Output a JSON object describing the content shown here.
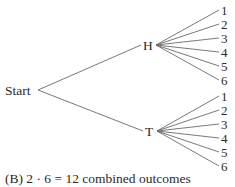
{
  "diagram": {
    "type": "tree",
    "root": {
      "label": "Start",
      "x": 38,
      "y": 90
    },
    "level1": [
      {
        "label": "H",
        "x": 156,
        "y": 45,
        "label_x": 143,
        "label_y": 50
      },
      {
        "label": "T",
        "x": 157,
        "y": 131,
        "label_x": 145,
        "label_y": 136
      }
    ],
    "leaves": {
      "labels": [
        "1",
        "2",
        "3",
        "4",
        "5",
        "6"
      ],
      "end_x": 219,
      "label_x": 221,
      "H_y": [
        10,
        24,
        38,
        52,
        66,
        80
      ],
      "T_y": [
        96,
        110,
        124,
        138,
        152,
        166
      ]
    }
  },
  "caption": "(B)  2 · 6 = 12 combined outcomes"
}
